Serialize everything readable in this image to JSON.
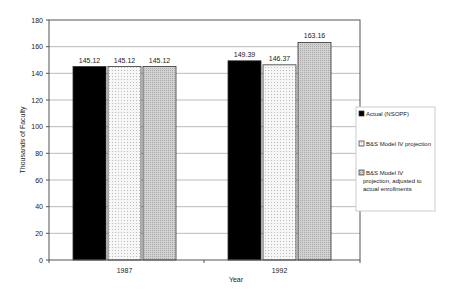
{
  "chart_data": {
    "type": "bar",
    "title": "",
    "xlabel": "Year",
    "ylabel": "Thousands of Faculty",
    "ylim": [
      0,
      180
    ],
    "yticks": [
      0,
      20,
      40,
      60,
      80,
      100,
      120,
      140,
      160,
      180
    ],
    "grid": true,
    "legend_position": "right",
    "categories": [
      "1987",
      "1992"
    ],
    "series": [
      {
        "name": "Actual (NSOPF)",
        "values": [
          145.12,
          149.39
        ],
        "labels": [
          "145.12",
          "149.39"
        ],
        "color": "#000000",
        "pattern": "solid"
      },
      {
        "name": "B&S Model IV projection",
        "values": [
          145.12,
          146.37
        ],
        "labels": [
          "145.12",
          "146.37"
        ],
        "color": "#f4f4f4",
        "pattern": "fine-dots"
      },
      {
        "name": "B&S Model IV projection, adjusted to actual enrollments",
        "values": [
          145.12,
          163.16
        ],
        "labels": [
          "145.12",
          "163.16"
        ],
        "color": "#c8c8c8",
        "pattern": "dense-dots"
      }
    ]
  },
  "legend": {
    "items": [
      {
        "lines": [
          "Actual (NSOPF)"
        ]
      },
      {
        "lines": [
          "B&S Model IV projection"
        ]
      },
      {
        "lines": [
          "B&S Model IV",
          "projection, adjusted to",
          "actual enrollments"
        ]
      }
    ]
  }
}
